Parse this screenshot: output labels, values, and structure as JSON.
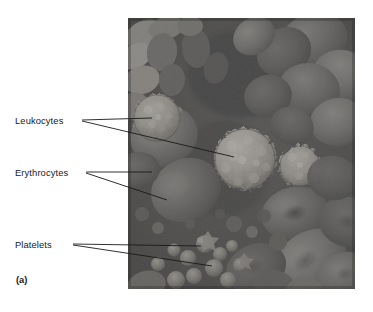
{
  "figure": {
    "panel_letter": "(a)",
    "micrograph": {
      "alt_name": "scanning-electron-micrograph-of-blood-cells",
      "frame": {
        "x": 128,
        "y": 18,
        "width": 227,
        "height": 271
      },
      "background_color": "#3b3b3b",
      "tone_range": {
        "dark": "#262626",
        "mid": "#6a6a6a",
        "light": "#cfcac2"
      }
    },
    "callouts": [
      {
        "id": "leukocytes",
        "label": "Leukocytes",
        "text_x": 15,
        "text_y": 115,
        "leaders": [
          {
            "x1": 82,
            "y1": 120,
            "x2": 152,
            "y2": 118
          },
          {
            "x1": 82,
            "y1": 121,
            "x2": 234,
            "y2": 157
          }
        ]
      },
      {
        "id": "erythrocytes",
        "label": "Erythrocytes",
        "text_x": 15,
        "text_y": 167,
        "leaders": [
          {
            "x1": 86,
            "y1": 172,
            "x2": 152,
            "y2": 172
          },
          {
            "x1": 86,
            "y1": 173,
            "x2": 167,
            "y2": 200
          }
        ]
      },
      {
        "id": "platelets",
        "label": "Platelets",
        "text_x": 15,
        "text_y": 239,
        "leaders": [
          {
            "x1": 73,
            "y1": 244,
            "x2": 201,
            "y2": 246
          },
          {
            "x1": 73,
            "y1": 245,
            "x2": 212,
            "y2": 266
          }
        ]
      }
    ],
    "leader_color": "#1a1a1a",
    "leader_width": 0.9
  }
}
